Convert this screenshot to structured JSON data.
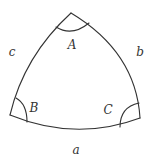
{
  "diagram": {
    "type": "spherical-triangle",
    "stroke_color": "#333333",
    "background": "#ffffff",
    "vertices": [
      {
        "name": "A",
        "x": 71,
        "y": 13
      },
      {
        "name": "B",
        "x": 10,
        "y": 115
      },
      {
        "name": "C",
        "x": 140,
        "y": 118
      }
    ],
    "angle_labels": {
      "A": "A",
      "B": "B",
      "C": "C"
    },
    "side_labels": {
      "a": "a",
      "b": "b",
      "c": "c"
    }
  }
}
